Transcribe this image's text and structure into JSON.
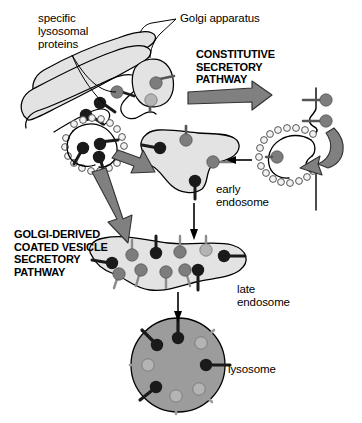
{
  "figure": {
    "background_color": "#ffffff"
  },
  "labels": {
    "specific_lysosomal_proteins": "specific\nlysosomal\nproteins",
    "golgi_apparatus": "Golgi apparatus",
    "constitutive_secretory_pathway": "CONSTITUTIVE\nSECRETORY\nPATHWAY",
    "golgi_derived_coated_vesicle_secretory_pathway": "GOLGI-DERIVED\nCOATED VESICLE\nSECRETORY\nPATHWAY",
    "early_endosome": "early\nendosome",
    "late_endosome": "late\nendosome",
    "lysosome": "lysosome"
  },
  "colors": {
    "organelle_fill": "#e3e3e3",
    "organelle_stroke": "#000000",
    "lysosome_fill": "#9c9c9c",
    "arrow_fill": "#808080",
    "arrow_stroke": "#333333",
    "receptor_dark": "#1a1a1a",
    "receptor_gray": "#7d7d7d",
    "receptor_light": "#b4b4b4",
    "clathrin_coat_fill": "#f2f2f2",
    "clathrin_coat_stroke": "#555555",
    "membrane_stroke": "#000000",
    "text": "#000000"
  },
  "structures": {
    "golgi_apparatus": {
      "name": "Golgi apparatus",
      "cisternae_count": 3,
      "description": "stacked flattened cisternae, light gray fill, black outline"
    },
    "transport_vesicle": {
      "name": "transport vesicle budding from Golgi",
      "cargo_count": 2
    },
    "golgi_coated_vesicle": {
      "name": "clathrin-coated vesicle budding from trans Golgi",
      "cargo_count": 3,
      "coat_beads": 18
    },
    "plasma_membrane_coated_pit": {
      "name": "clathrin coated pit at plasma membrane",
      "cargo_count": 1,
      "coat_beads": 20
    },
    "plasma_membrane": {
      "name": "plasma membrane",
      "surface_receptors": 2
    },
    "early_endosome": {
      "name": "early endosome",
      "receptors_dark": 1,
      "receptors_gray": 2
    },
    "late_endosome": {
      "name": "late endosome",
      "receptors_dark": 3,
      "receptors_gray": 6
    },
    "lysosome": {
      "name": "lysosome",
      "receptors_dark": 3,
      "receptors_gray": 4
    }
  },
  "arrows": {
    "constitutive": "thick gray arrow pointing right from Golgi to plasma membrane",
    "endocytic": "curved gray arrow from plasma membrane into coated pit",
    "coated_pit_to_early_endosome": "thin black arrow pointing left into early endosome",
    "golgi_to_early_endosome": "gray arrow pointing down-right from Golgi coated vesicle",
    "golgi_to_late_endosome": "gray arrow pointing down-right toward late endosome",
    "early_to_late_endosome": "thin black arrow pointing down",
    "late_endosome_to_lysosome": "thin black arrow pointing down"
  },
  "leader_lines": {
    "specific_lysosomal_proteins": "two leader lines from the label to dark receptors in the Golgi",
    "golgi_apparatus": "leader line from the label to the top Golgi cisterna"
  }
}
